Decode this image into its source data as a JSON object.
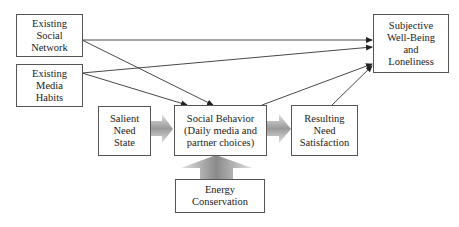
{
  "diagram": {
    "type": "flow-model",
    "nodes": [
      {
        "id": "social-network",
        "label": "Existing\nSocial\nNetwork"
      },
      {
        "id": "media-habits",
        "label": "Existing\nMedia\nHabits"
      },
      {
        "id": "salient-need",
        "label": "Salient\nNeed\nState"
      },
      {
        "id": "social-behavior",
        "label": "Social Behavior\n(Daily media and\npartner choices)"
      },
      {
        "id": "need-satisfaction",
        "label": "Resulting\nNeed\nSatisfaction"
      },
      {
        "id": "energy-conservation",
        "label": "Energy\nConservation"
      },
      {
        "id": "well-being",
        "label": "Subjective\nWell-Being\nand\nLoneliness"
      }
    ],
    "edges": [
      {
        "from": "social-network",
        "to": "well-being",
        "style": "line-arrow"
      },
      {
        "from": "social-network",
        "to": "social-behavior",
        "style": "line-arrow"
      },
      {
        "from": "media-habits",
        "to": "well-being",
        "style": "line-arrow"
      },
      {
        "from": "media-habits",
        "to": "social-behavior",
        "style": "line-arrow"
      },
      {
        "from": "social-behavior",
        "to": "well-being",
        "style": "line-arrow"
      },
      {
        "from": "need-satisfaction",
        "to": "well-being",
        "style": "line-arrow"
      },
      {
        "from": "salient-need",
        "to": "social-behavior",
        "style": "block-arrow"
      },
      {
        "from": "social-behavior",
        "to": "need-satisfaction",
        "style": "block-arrow"
      },
      {
        "from": "energy-conservation",
        "to": "social-behavior",
        "style": "block-arrow"
      }
    ],
    "colors": {
      "border": "#555555",
      "line": "#333333",
      "block_arrow_light": "#d8d8d8",
      "block_arrow_dark": "#7a7a7a"
    }
  }
}
